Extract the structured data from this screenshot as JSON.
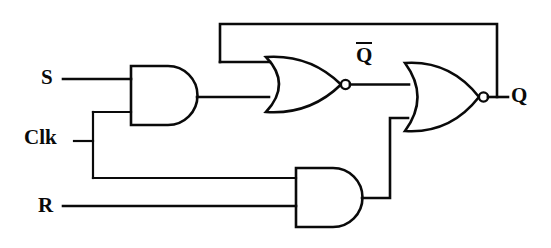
{
  "diagram": {
    "background_color": "#ffffff",
    "line_color": "#0a0a0a",
    "labels": {
      "s": "S",
      "clk": "Clk",
      "r": "R",
      "q": "Q",
      "q_bar": "Q"
    },
    "gates": [
      {
        "id": "and-gate-top",
        "type": "AND",
        "inputs": [
          "S",
          "Clk"
        ],
        "output": "S-and-Clk"
      },
      {
        "id": "and-gate-bottom",
        "type": "AND",
        "inputs": [
          "R",
          "Clk"
        ],
        "output": "R-and-Clk"
      },
      {
        "id": "nor-gate-top",
        "type": "NOR",
        "inputs": [
          "Q",
          "S-and-Clk"
        ],
        "output": "Q-bar"
      },
      {
        "id": "nor-gate-bottom",
        "type": "NOR",
        "inputs": [
          "Q-bar",
          "R-and-Clk"
        ],
        "output": "Q"
      }
    ],
    "nets": [
      "S to AND-top input 1",
      "Clk bus to AND-top input 2 and AND-bottom input 1",
      "R to AND-bottom input 2",
      "AND-top output to NOR-top input 2",
      "AND-bottom output to NOR-bottom input 2",
      "NOR-top output Q-bar to NOR-bottom input 1",
      "NOR-bottom output Q feedback to NOR-top input 1"
    ]
  }
}
